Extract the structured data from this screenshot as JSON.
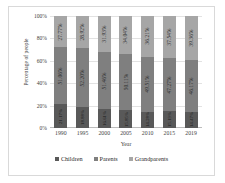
{
  "chart_data": {
    "type": "bar",
    "subtype": "stacked-percentage-column",
    "title": "",
    "xlabel": "Year",
    "ylabel": "Percentage of people",
    "categories": [
      "1990",
      "1995",
      "2000",
      "2005",
      "2010",
      "2015",
      "2019"
    ],
    "ylim": [
      0,
      100
    ],
    "yticks": [
      "0%",
      "20%",
      "40%",
      "60%",
      "80%",
      "100%"
    ],
    "ytick_values": [
      0,
      20,
      40,
      60,
      80,
      100
    ],
    "grid": true,
    "legend_position": "bottom",
    "series": [
      {
        "name": "Children",
        "color": "#595959",
        "values": [
          21.17,
          18.88,
          16.61,
          15.85,
          14.28,
          15.19,
          14.47
        ],
        "labels": [
          "21.17%",
          "18.88%",
          "16.61%",
          "15.85%",
          "14.28%",
          "15.19%",
          "14.47%"
        ]
      },
      {
        "name": "Parents",
        "color": "#7f7f7f",
        "values": [
          51.06,
          52.2,
          51.46,
          50.11,
          49.51,
          47.27,
          46.17
        ],
        "labels": [
          "51.06%",
          "52.20%",
          "51.46%",
          "50.11%",
          "49.51%",
          "47.27%",
          "46.17%"
        ]
      },
      {
        "name": "Grandparents",
        "color": "#a6a6a6",
        "values": [
          27.77,
          28.92,
          31.93,
          34.04,
          36.21,
          37.54,
          39.36
        ],
        "labels": [
          "27.77%",
          "28.92%",
          "31.93%",
          "34.04%",
          "36.21%",
          "37.54%",
          "39.36%"
        ]
      }
    ]
  },
  "legend": {
    "items": [
      {
        "label": "Children",
        "color": "#595959"
      },
      {
        "label": "Parents",
        "color": "#7f7f7f"
      },
      {
        "label": "Grandparents",
        "color": "#a6a6a6"
      }
    ]
  }
}
